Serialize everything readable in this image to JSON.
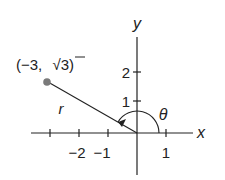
{
  "diagram": {
    "type": "polar-coordinate-plot",
    "axes": {
      "x_label": "x",
      "y_label": "y",
      "x_ticks": [
        {
          "value": -3,
          "label": ""
        },
        {
          "value": -2,
          "label": "−2"
        },
        {
          "value": -1,
          "label": "−1"
        },
        {
          "value": 1,
          "label": "1"
        }
      ],
      "y_ticks": [
        {
          "value": 1,
          "label": "1"
        },
        {
          "value": 2,
          "label": "2"
        }
      ]
    },
    "point": {
      "x": -3,
      "y": 1.732,
      "label": "(−3,  √3)",
      "label_paren_open": "(−3,",
      "label_sqrt": "√3)",
      "color": "#7a7a7a"
    },
    "radius_label": "r",
    "angle_label": "θ",
    "line_color": "#222222"
  }
}
